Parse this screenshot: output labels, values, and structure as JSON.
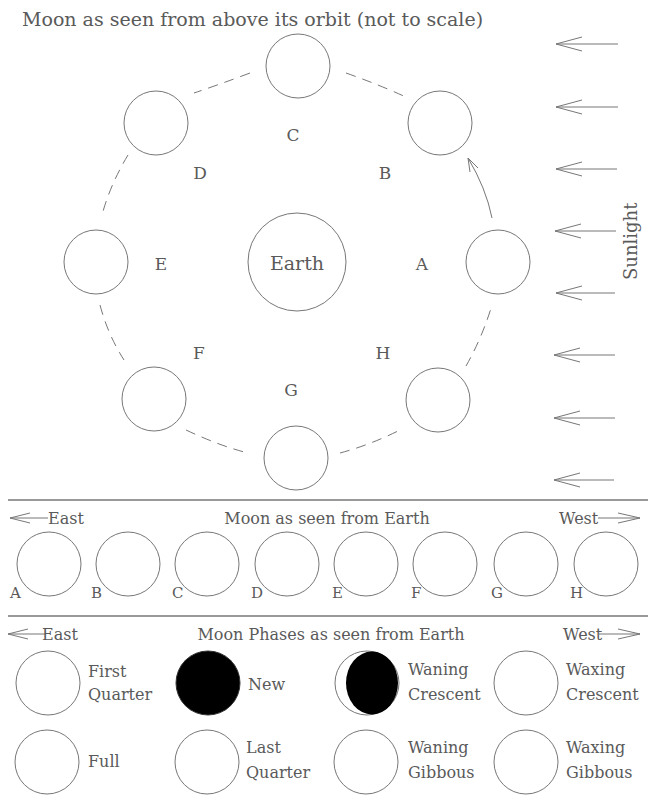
{
  "title": "Moon as seen from above its orbit (not to scale)",
  "orbit": {
    "earth_label": "Earth",
    "sunlight_label": "Sunlight",
    "positions": [
      {
        "id": "A",
        "label": "A"
      },
      {
        "id": "B",
        "label": "B"
      },
      {
        "id": "C",
        "label": "C"
      },
      {
        "id": "D",
        "label": "D"
      },
      {
        "id": "E",
        "label": "E"
      },
      {
        "id": "F",
        "label": "F"
      },
      {
        "id": "G",
        "label": "G"
      },
      {
        "id": "H",
        "label": "H"
      }
    ]
  },
  "seen_from_earth": {
    "title": "Moon as seen from Earth",
    "east_label": "East",
    "west_label": "West",
    "labels": [
      "A",
      "B",
      "C",
      "D",
      "E",
      "F",
      "G",
      "H"
    ]
  },
  "phases": {
    "title": "Moon Phases as seen from Earth",
    "east_label": "East",
    "west_label": "West",
    "items": [
      {
        "line1": "First",
        "line2": "Quarter",
        "fill": "empty"
      },
      {
        "line1": "New",
        "line2": "",
        "fill": "full-dark"
      },
      {
        "line1": "Waning",
        "line2": "Crescent",
        "fill": "crescent-dark"
      },
      {
        "line1": "Waxing",
        "line2": "Crescent",
        "fill": "empty"
      },
      {
        "line1": "Full",
        "line2": "",
        "fill": "empty"
      },
      {
        "line1": "Last",
        "line2": "Quarter",
        "fill": "empty"
      },
      {
        "line1": "Waning",
        "line2": "Gibbous",
        "fill": "empty"
      },
      {
        "line1": "Waxing",
        "line2": "Gibbous",
        "fill": "empty"
      }
    ]
  }
}
